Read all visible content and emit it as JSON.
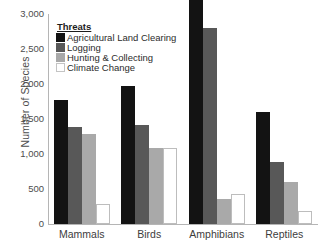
{
  "chart_data": {
    "type": "bar",
    "title": "",
    "xlabel": "",
    "ylabel": "Number of Species",
    "ylim": [
      0,
      3000
    ],
    "yticks": [
      0,
      500,
      1000,
      1500,
      2000,
      2500,
      3000
    ],
    "ytick_labels": [
      "0",
      "500",
      "1,000",
      "1,500",
      "2,000",
      "2,500",
      "3,000"
    ],
    "grid": false,
    "legend_position": "top-left",
    "legend_title": "Threats",
    "categories": [
      "Mammals",
      "Birds",
      "Amphibians",
      "Reptiles"
    ],
    "series": [
      {
        "name": "Agricultural Land Clearing",
        "color": "#131313",
        "values": [
          1766,
          1970,
          3220,
          1600
        ]
      },
      {
        "name": "Logging",
        "color": "#585858",
        "values": [
          1390,
          1420,
          2800,
          880
        ]
      },
      {
        "name": "Hunting & Collecting",
        "color": "#a9a9a9",
        "values": [
          1280,
          1080,
          360,
          600
        ]
      },
      {
        "name": "Climate Change",
        "color": "#ffffff",
        "values": [
          280,
          1080,
          430,
          190
        ]
      }
    ]
  }
}
